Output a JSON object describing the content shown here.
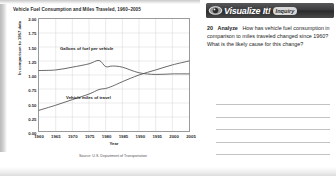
{
  "figure": {
    "title": "Vehicle Fuel Consumption and Miles Traveled, 1960–2005",
    "source": "Source: U.S. Department of Transportation"
  },
  "chart_data": {
    "type": "line",
    "title": "Vehicle Fuel Consumption and Miles Traveled, 1960–2005",
    "xlabel": "Year",
    "ylabel": "In comparison to 1967 data",
    "xlim": [
      1960,
      2005
    ],
    "ylim": [
      0.0,
      2.0
    ],
    "grid": true,
    "legend_position": "inline-labels",
    "yticks": [
      "0.00",
      "0.25",
      "0.50",
      "0.75",
      "1.00",
      "1.25",
      "1.50",
      "1.75",
      "2.00"
    ],
    "xticks": [
      "1960",
      "1965",
      "1970",
      "1975",
      "1980",
      "1985",
      "1990",
      "1995",
      "2000",
      "2005"
    ],
    "x": [
      1960,
      1965,
      1970,
      1975,
      1978,
      1980,
      1982,
      1985,
      1990,
      1995,
      2000,
      2005
    ],
    "series": [
      {
        "name": "Gallons of fuel per vehicle",
        "values": [
          1.08,
          1.09,
          1.14,
          1.2,
          1.26,
          1.15,
          1.16,
          1.14,
          1.04,
          1.01,
          1.02,
          1.02
        ]
      },
      {
        "name": "Vehicle miles of travel",
        "values": [
          0.37,
          0.46,
          0.56,
          0.66,
          0.74,
          0.76,
          0.8,
          0.88,
          1.0,
          1.09,
          1.18,
          1.25
        ]
      }
    ],
    "annotations": [
      {
        "text": "Gallons of fuel per vehicle",
        "x": 1970,
        "y": 1.42
      },
      {
        "text": "Vehicle miles of travel",
        "x": 1974,
        "y": 0.6
      }
    ]
  },
  "panel": {
    "banner_title": "Visualize It!",
    "badge_label": "Inquiry",
    "eye_icon": "eye-icon",
    "question": {
      "number": "20",
      "verb": "Analyze",
      "text": "How has vehicle fuel consumption in comparison to miles traveled changed since 1960? What is the likely cause for this change?"
    },
    "answer_lines": [
      "",
      "",
      "",
      "",
      ""
    ]
  },
  "colors": {
    "banner_dark": "#3a3a3c",
    "badge_gray": "#d8d8d8",
    "curve": "#555555",
    "grid": "#d6d6d6"
  }
}
